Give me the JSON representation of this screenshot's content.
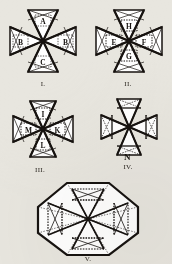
{
  "plate": {
    "title": "Geometric construction plate of eight-pointed Maltese-cross figures",
    "background_color": "#e8e6df",
    "ink_color": "#171310",
    "width": 172,
    "height": 264
  },
  "figures": [
    {
      "id": "figure-1",
      "caption": "I.",
      "shape": "maltese-cross",
      "labels": [
        {
          "position": "top",
          "text": "A"
        },
        {
          "position": "left",
          "text": "B"
        },
        {
          "position": "right",
          "text": "B"
        },
        {
          "position": "bottom",
          "text": "C"
        }
      ]
    },
    {
      "id": "figure-2",
      "caption": "II.",
      "shape": "maltese-cross",
      "labels": [
        {
          "position": "top",
          "text": "H"
        },
        {
          "position": "left",
          "text": "E"
        },
        {
          "position": "right",
          "text": "F"
        },
        {
          "position": "bottom",
          "text": "G"
        }
      ]
    },
    {
      "id": "figure-3",
      "caption": "III.",
      "shape": "maltese-cross",
      "labels": [
        {
          "position": "top",
          "text": "I"
        },
        {
          "position": "left",
          "text": "M"
        },
        {
          "position": "right",
          "text": "K"
        },
        {
          "position": "bottom",
          "text": "L"
        }
      ]
    },
    {
      "id": "figure-4",
      "caption": "IV.",
      "shape": "maltese-cross",
      "labels": [
        {
          "position": "below-center",
          "text": "N"
        }
      ]
    },
    {
      "id": "figure-5",
      "caption": "V.",
      "shape": "octagon-with-maltese-cross",
      "labels": []
    }
  ]
}
